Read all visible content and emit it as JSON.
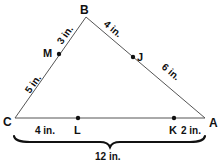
{
  "diagram": {
    "shape": "triangle",
    "vertices": {
      "A": {
        "label": "A"
      },
      "B": {
        "label": "B"
      },
      "C": {
        "label": "C"
      }
    },
    "points": {
      "M": {
        "label": "M",
        "on": "CB"
      },
      "J": {
        "label": "J",
        "on": "BA"
      },
      "L": {
        "label": "L",
        "on": "CA"
      },
      "K": {
        "label": "K",
        "on": "CA"
      }
    },
    "measurements": {
      "BM": "3 in.",
      "MC": "5 in.",
      "BJ": "4 in.",
      "JA": "6 in.",
      "CL": "4 in.",
      "KA": "2 in.",
      "CA_total": "12 in."
    },
    "colors": {
      "line": "#555555",
      "text": "#111111",
      "dot": "#111111"
    }
  }
}
